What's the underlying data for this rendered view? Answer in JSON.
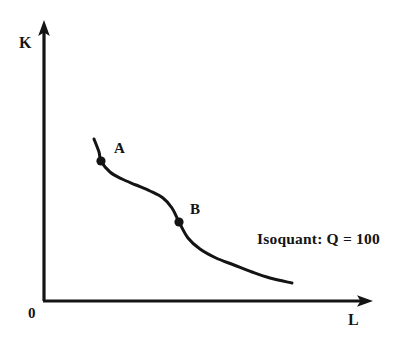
{
  "figure": {
    "background_color": "#ffffff",
    "ink_color": "#141414"
  },
  "axes": {
    "y_label": "K",
    "x_label": "L",
    "origin_label": "0"
  },
  "annotations": {
    "point_a_label": "A",
    "point_b_label": "B",
    "isoquant_label": "Isoquant: Q = 100"
  },
  "chart_data": {
    "type": "line",
    "title": "",
    "subtitle": "",
    "xlabel": "L",
    "ylabel": "K",
    "xlim": [
      0,
      100
    ],
    "ylim": [
      0,
      100
    ],
    "grid": false,
    "legend": "none",
    "axis_style": "arrowed, no tick marks, no tick labels",
    "origin_label": "0",
    "series": [
      {
        "name": "Isoquant: Q = 100",
        "kind": "isoquant",
        "smooth": true,
        "annotation": "Isoquant: Q = 100",
        "points_px": [
          [
            94,
            139
          ],
          [
            99,
            152
          ],
          [
            101,
            161
          ],
          [
            110,
            172
          ],
          [
            122,
            179
          ],
          [
            136,
            185
          ],
          [
            150,
            191
          ],
          [
            163,
            198
          ],
          [
            172,
            208
          ],
          [
            179,
            222
          ],
          [
            188,
            238
          ],
          [
            200,
            249
          ],
          [
            216,
            258
          ],
          [
            234,
            265
          ],
          [
            252,
            272
          ],
          [
            270,
            278
          ],
          [
            292,
            283
          ]
        ]
      }
    ],
    "markers": [
      {
        "label": "A",
        "x_px": 101,
        "y_px": 161,
        "label_x_px": 114,
        "label_y_px": 141,
        "style": "filled-circle"
      },
      {
        "label": "B",
        "x_px": 179,
        "y_px": 222,
        "label_x_px": 190,
        "label_y_px": 202,
        "style": "filled-circle"
      }
    ],
    "axis_geometry_px": {
      "origin": [
        44,
        301
      ],
      "y_axis_top": [
        44,
        22
      ],
      "x_axis_right": [
        372,
        301
      ]
    }
  }
}
